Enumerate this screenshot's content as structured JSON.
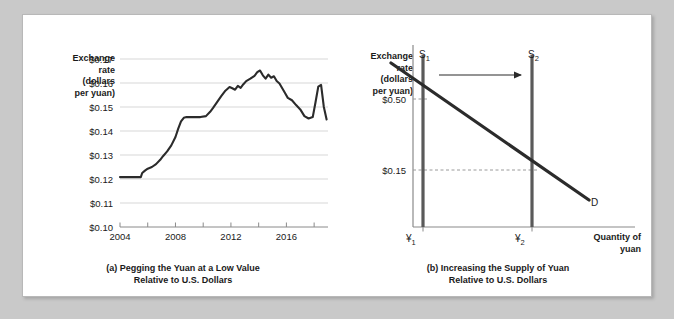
{
  "figure": {
    "background_color": "#c9c9c9",
    "card_color": "#ffffff",
    "ink_color": "#2b2b2b"
  },
  "panel_a": {
    "caption_line1": "(a) Pegging the Yuan at a Low Value",
    "caption_line2": "Relative to U.S. Dollars",
    "y_axis_title": "Exchange\nrate\n(dollars\nper yuan)",
    "chart_data": {
      "type": "line",
      "title": "(a) Pegging the Yuan at a Low Value Relative to U.S. Dollars",
      "xlabel": "",
      "ylabel": "Exchange rate (dollars per yuan)",
      "xlim": [
        2004,
        2019
      ],
      "ylim": [
        0.1,
        0.17
      ],
      "grid": true,
      "legend": "none",
      "y_ticks": [
        "$0.10",
        "$0.11",
        "$0.12",
        "$0.13",
        "$0.14",
        "$0.15",
        "$0.16",
        "$0.17"
      ],
      "y_tick_values": [
        0.1,
        0.11,
        0.12,
        0.13,
        0.14,
        0.15,
        0.16,
        0.17
      ],
      "x_ticks": [
        2004,
        2006,
        2008,
        2010,
        2012,
        2014,
        2016,
        2018
      ],
      "x_tick_labels": [
        "2004",
        "",
        "2008",
        "",
        "2012",
        "",
        "2016",
        ""
      ],
      "series": [
        {
          "name": "Dollars per yuan",
          "x": [
            2004.0,
            2004.4,
            2004.8,
            2005.2,
            2005.5,
            2005.6,
            2005.8,
            2006.0,
            2006.3,
            2006.6,
            2006.9,
            2007.1,
            2007.4,
            2007.7,
            2008.0,
            2008.2,
            2008.4,
            2008.6,
            2008.8,
            2009.0,
            2009.4,
            2009.8,
            2010.2,
            2010.5,
            2010.7,
            2011.0,
            2011.3,
            2011.6,
            2011.9,
            2012.1,
            2012.3,
            2012.5,
            2012.7,
            2012.9,
            2013.1,
            2013.4,
            2013.7,
            2013.9,
            2014.1,
            2014.3,
            2014.5,
            2014.7,
            2014.9,
            2015.1,
            2015.3,
            2015.5,
            2015.7,
            2015.9,
            2016.1,
            2016.4,
            2016.7,
            2017.0,
            2017.3,
            2017.6,
            2017.9,
            2018.1,
            2018.3,
            2018.5,
            2018.7,
            2018.9
          ],
          "y": [
            0.1208,
            0.1208,
            0.1208,
            0.1208,
            0.1208,
            0.1225,
            0.1235,
            0.1243,
            0.125,
            0.1262,
            0.128,
            0.1295,
            0.1315,
            0.134,
            0.1375,
            0.141,
            0.144,
            0.1455,
            0.1458,
            0.1458,
            0.1458,
            0.1458,
            0.1462,
            0.148,
            0.1495,
            0.152,
            0.1545,
            0.1568,
            0.1583,
            0.1578,
            0.1572,
            0.1588,
            0.158,
            0.1595,
            0.1608,
            0.1618,
            0.163,
            0.1645,
            0.1652,
            0.1632,
            0.1618,
            0.1635,
            0.1622,
            0.1628,
            0.1608,
            0.1598,
            0.1578,
            0.1558,
            0.1538,
            0.1528,
            0.1508,
            0.149,
            0.1462,
            0.1452,
            0.1458,
            0.152,
            0.1585,
            0.1592,
            0.15,
            0.1448
          ]
        }
      ]
    }
  },
  "panel_b": {
    "caption_line1": "(b) Increasing the Supply of Yuan",
    "caption_line2": "Relative to U.S. Dollars",
    "y_axis_title": "Exchange\nrate\n(dollars\nper yuan)",
    "x_axis_title_line1": "Quantity of",
    "x_axis_title_line2": "yuan",
    "chart_data": {
      "type": "line",
      "title": "(b) Increasing the Supply of Yuan Relative to U.S. Dollars",
      "xlabel": "Quantity of yuan",
      "ylabel": "Exchange rate (dollars per yuan)",
      "grid": false,
      "legend": "inline-labels",
      "y_tick_labels": [
        "$0.50",
        "$0.15"
      ],
      "y_tick_values": [
        0.5,
        0.15
      ],
      "x_tick_labels": [
        "¥1",
        "¥2"
      ],
      "curves": [
        {
          "name": "S1",
          "label": "S",
          "subscript": "1",
          "type": "supply",
          "shape": "vertical",
          "quantity": "¥1",
          "equilibrium_price": "$0.50"
        },
        {
          "name": "S2",
          "label": "S",
          "subscript": "2",
          "type": "supply",
          "shape": "vertical",
          "quantity": "¥2",
          "equilibrium_price": "$0.15"
        },
        {
          "name": "D",
          "label": "D",
          "subscript": "",
          "type": "demand",
          "shape": "downward-sloping"
        }
      ],
      "annotations": [
        {
          "name": "shift-arrow",
          "direction": "right",
          "meaning": "supply increases"
        }
      ]
    }
  }
}
